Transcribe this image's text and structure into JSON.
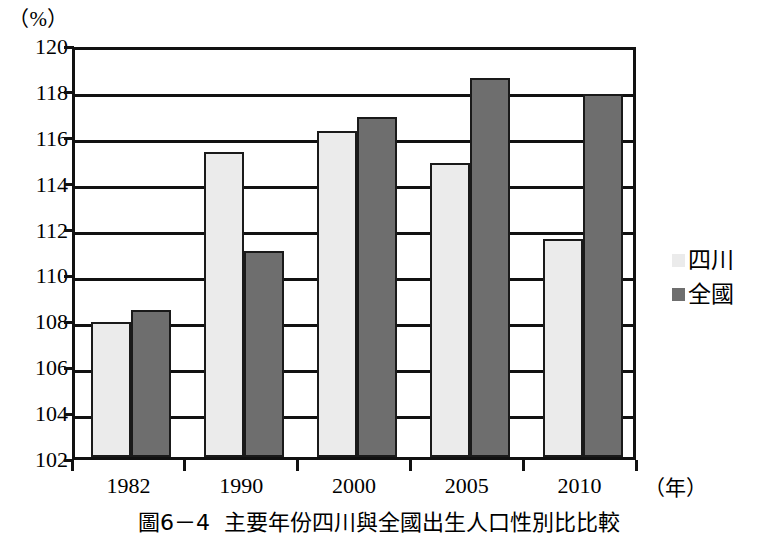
{
  "chart_data": {
    "type": "bar",
    "title": "",
    "caption_number": "圖6－4",
    "caption_text": "主要年份四川與全國出生人口性別比比較",
    "categories": [
      "1982",
      "1990",
      "2000",
      "2005",
      "2010"
    ],
    "series": [
      {
        "name": "四川",
        "color": "#ebebeb",
        "values": [
          107.9,
          115.3,
          116.2,
          114.8,
          111.5
        ]
      },
      {
        "name": "全國",
        "color": "#6e6e6e",
        "values": [
          108.4,
          111.0,
          116.8,
          118.5,
          117.8
        ]
      }
    ],
    "xlabel": "（年）",
    "ylabel": "（%）",
    "ylim": [
      102,
      120
    ],
    "ytick_step": 2,
    "yticks": [
      "120",
      "118",
      "116",
      "114",
      "112",
      "110",
      "108",
      "106",
      "104",
      "102"
    ],
    "grid": true,
    "legend_position": "right"
  },
  "axes": {
    "unit_label": "（%）",
    "x_unit_label": "（年）"
  },
  "legend": {
    "items": [
      {
        "label": "四川",
        "swatch": "legend-swatch-light"
      },
      {
        "label": "全國",
        "swatch": "legend-swatch-dark"
      }
    ]
  },
  "caption": {
    "number": "圖6－4",
    "text": "主要年份四川與全國出生人口性別比比較"
  }
}
